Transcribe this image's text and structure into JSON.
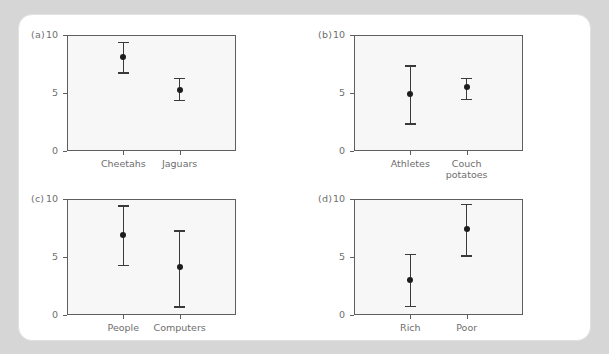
{
  "figure": {
    "background_color": "#d6d6d6",
    "card_color": "#ffffff",
    "plot_fill": "#f7f7f7",
    "axis_color": "#5e5e5e",
    "marker_color": "#1d1d1d",
    "text_color": "#6e6e6e"
  },
  "chart_data": [
    {
      "type": "scatter",
      "panel": "(a)",
      "title": "",
      "xlabel": "",
      "ylabel": "",
      "ylim": [
        0,
        10
      ],
      "yticks": [
        0,
        5,
        10
      ],
      "ytick_labels": [
        "0",
        "5",
        "10"
      ],
      "grid": false,
      "legend": "none",
      "categories": [
        "Cheetahs",
        "Jaguars"
      ],
      "values": [
        8.1,
        5.3
      ],
      "err_low": [
        6.8,
        4.4
      ],
      "err_high": [
        9.4,
        6.3
      ]
    },
    {
      "type": "scatter",
      "panel": "(b)",
      "title": "",
      "xlabel": "",
      "ylabel": "",
      "ylim": [
        0,
        10
      ],
      "yticks": [
        0,
        5,
        10
      ],
      "ytick_labels": [
        "0",
        "5",
        "10"
      ],
      "grid": false,
      "legend": "none",
      "categories": [
        "Athletes",
        "Couch\npotatoes"
      ],
      "values": [
        4.9,
        5.5
      ],
      "err_low": [
        2.4,
        4.5
      ],
      "err_high": [
        7.4,
        6.3
      ]
    },
    {
      "type": "scatter",
      "panel": "(c)",
      "title": "",
      "xlabel": "",
      "ylabel": "",
      "ylim": [
        0,
        10
      ],
      "yticks": [
        0,
        5,
        10
      ],
      "ytick_labels": [
        "0",
        "5",
        "10"
      ],
      "grid": false,
      "legend": "none",
      "categories": [
        "People",
        "Computers"
      ],
      "values": [
        6.9,
        4.1
      ],
      "err_low": [
        4.35,
        0.75
      ],
      "err_high": [
        9.45,
        7.3
      ]
    },
    {
      "type": "scatter",
      "panel": "(d)",
      "title": "",
      "xlabel": "",
      "ylabel": "",
      "ylim": [
        0,
        10
      ],
      "yticks": [
        0,
        5,
        10
      ],
      "ytick_labels": [
        "0",
        "5",
        "10"
      ],
      "grid": false,
      "legend": "none",
      "categories": [
        "Rich",
        "Poor"
      ],
      "values": [
        3.05,
        7.4
      ],
      "err_low": [
        0.8,
        5.15
      ],
      "err_high": [
        5.3,
        9.6
      ]
    }
  ]
}
